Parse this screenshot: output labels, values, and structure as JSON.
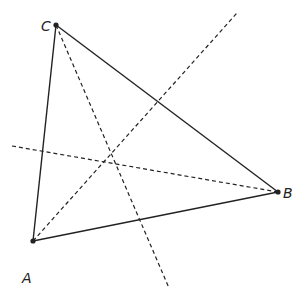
{
  "diagram": {
    "type": "triangle-with-concurrent-dashed-lines",
    "colors": {
      "stroke": "#222222",
      "background": "#ffffff"
    },
    "vertices": [
      {
        "id": "A",
        "label": "A",
        "x": 33,
        "y": 241,
        "label_x": 22,
        "label_y": 283
      },
      {
        "id": "B",
        "label": "B",
        "x": 278,
        "y": 192,
        "label_x": 283,
        "label_y": 198
      },
      {
        "id": "C",
        "label": "C",
        "x": 56,
        "y": 25,
        "label_x": 41,
        "label_y": 31
      }
    ],
    "sides": [
      {
        "from": "A",
        "to": "B"
      },
      {
        "from": "B",
        "to": "C"
      },
      {
        "from": "C",
        "to": "A"
      }
    ],
    "dashed_lines": [
      {
        "name": "line-through-C",
        "x1": 56,
        "y1": 25,
        "x2": 169,
        "y2": 288
      },
      {
        "name": "line-through-A",
        "x1": 33,
        "y1": 241,
        "x2": 237,
        "y2": 13
      },
      {
        "name": "line-through-B",
        "x1": 12,
        "y1": 146,
        "x2": 278,
        "y2": 192
      }
    ],
    "intersection": {
      "x": 116,
      "y": 163
    }
  }
}
